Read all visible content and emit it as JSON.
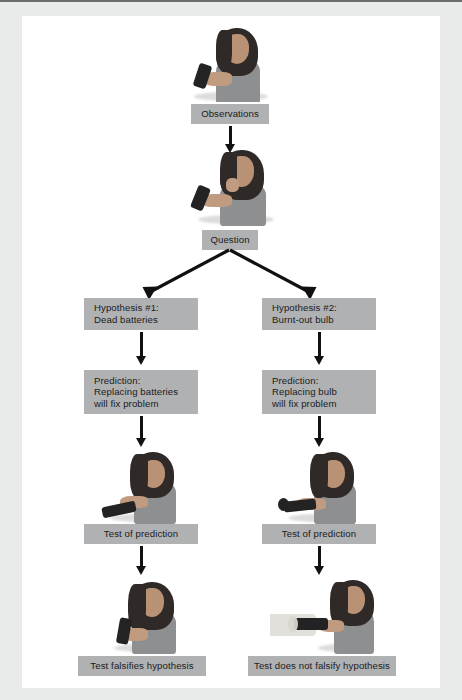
{
  "diagram": {
    "box_color": "#b0b1b3",
    "box_color_light": "#c3c4c5",
    "arrow_color": "#111111",
    "page_background": "#e9eaea",
    "canvas_background": "#ffffff"
  },
  "nodes": {
    "observations": {
      "label": "Observations"
    },
    "question": {
      "label": "Question"
    },
    "hypothesis_1": {
      "line1": "Hypothesis #1:",
      "line2": "Dead batteries"
    },
    "hypothesis_2": {
      "line1": "Hypothesis #2:",
      "line2": "Burnt-out bulb"
    },
    "prediction_1": {
      "line1": "Prediction:",
      "line2": "Replacing batteries",
      "line3": "will fix problem"
    },
    "prediction_2": {
      "line1": "Prediction:",
      "line2": "Replacing bulb",
      "line3": "will fix problem"
    },
    "test_1": {
      "label": "Test of prediction"
    },
    "test_2": {
      "label": "Test of prediction"
    },
    "result_1": {
      "label": "Test falsifies hypothesis"
    },
    "result_2": {
      "label": "Test does not falsify hypothesis"
    }
  },
  "photos": {
    "photo_observations": {
      "caption": "Woman holding a flashlight that will not turn on"
    },
    "photo_question": {
      "caption": "Woman thinking with hand on chin while holding flashlight"
    },
    "photo_test_1": {
      "caption": "Woman inserting new batteries into the flashlight"
    },
    "photo_test_2": {
      "caption": "Woman replacing the bulb of the flashlight"
    },
    "photo_result_1": {
      "caption": "Flashlight still does not light after new batteries"
    },
    "photo_result_2": {
      "caption": "Flashlight lights up after replacing the bulb"
    }
  }
}
